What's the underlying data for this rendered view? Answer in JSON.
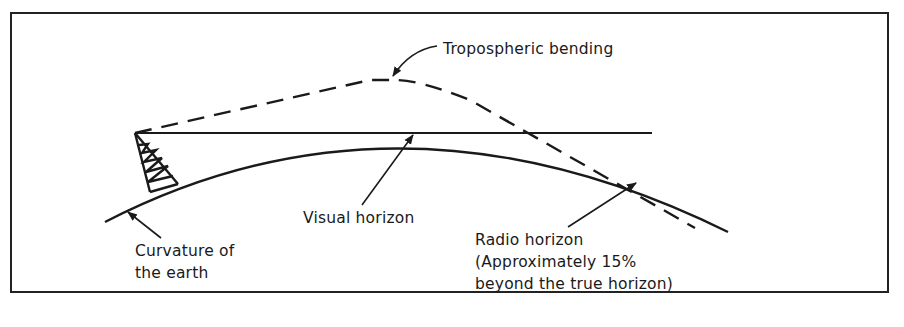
{
  "diagram": {
    "labels": {
      "tropospheric_bending": "Tropospheric bending",
      "visual_horizon": "Visual horizon",
      "curvature_line1": "Curvature of",
      "curvature_line2": "the earth",
      "radio_line1": "Radio horizon",
      "radio_line2": "(Approximately 15%",
      "radio_line3": "beyond the true horizon)"
    },
    "elements": {
      "antenna_tower": "lattice-tower-icon",
      "earth_curve": "solid-arc",
      "visual_path": "solid-horizontal-line",
      "radio_path": "dashed-curve"
    },
    "colors": {
      "stroke": "#1a1a1a",
      "background": "#ffffff"
    }
  }
}
